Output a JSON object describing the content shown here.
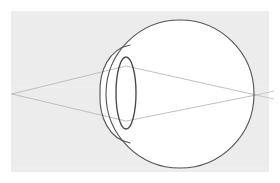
{
  "figure": {
    "title": "Optical diagram of the human eye",
    "canvas": {
      "width": 280,
      "height": 183
    },
    "background": {
      "plate_color": "#ececec",
      "page_color": "#ffffff",
      "plate_rect": {
        "x": 11,
        "y": 11,
        "width": 258,
        "height": 161
      }
    },
    "colors": {
      "outline_stroke": "#555555",
      "ray_stroke": "#b9b9b9",
      "interior_fill": "#ffffff",
      "lens_stroke": "#4a4a4a",
      "plate": "#ececec"
    },
    "parts": [
      {
        "name": "eyeball",
        "label": "Eyeball (sclera / globe)",
        "shape": "circle",
        "cx": 180,
        "cy": 94,
        "r": 74,
        "stroke": "#555555",
        "stroke_width": 1.1,
        "fill": "#ffffff"
      },
      {
        "name": "cornea",
        "label": "Cornea",
        "shape": "arc",
        "apex_x": 100,
        "apex_y": 94,
        "top_x": 128,
        "top_y": 46,
        "bottom_x": 128,
        "bottom_y": 142,
        "stroke": "#555555",
        "stroke_width": 1.1,
        "fill": "#ffffff"
      },
      {
        "name": "lens",
        "label": "Crystalline lens",
        "shape": "ellipse",
        "cx": 126,
        "cy": 93,
        "rx": 10,
        "ry": 36,
        "stroke": "#4a4a4a",
        "stroke_width": 1.3,
        "fill": "none"
      }
    ],
    "rays": {
      "label": "Light rays",
      "source_point": {
        "x": 12,
        "y": 94
      },
      "focus_point": {
        "x": 256,
        "y": 95
      },
      "stroke": "#b9b9b9",
      "stroke_width": 0.9,
      "paths": [
        {
          "name": "upper-ray",
          "points": [
            {
              "x": 12,
              "y": 94
            },
            {
              "x": 126,
              "y": 66
            },
            {
              "x": 256,
              "y": 95
            },
            {
              "x": 272,
              "y": 99
            }
          ]
        },
        {
          "name": "lower-ray",
          "points": [
            {
              "x": 12,
              "y": 94
            },
            {
              "x": 126,
              "y": 121
            },
            {
              "x": 256,
              "y": 95
            },
            {
              "x": 272,
              "y": 92
            }
          ]
        }
      ],
      "aperture_chords": [
        {
          "name": "upper-aperture-chord",
          "x1": 12,
          "y1": 94,
          "x2": 272,
          "y2": 99
        },
        {
          "name": "lower-aperture-chord",
          "x1": 12,
          "y1": 94,
          "x2": 272,
          "y2": 92
        }
      ]
    }
  }
}
